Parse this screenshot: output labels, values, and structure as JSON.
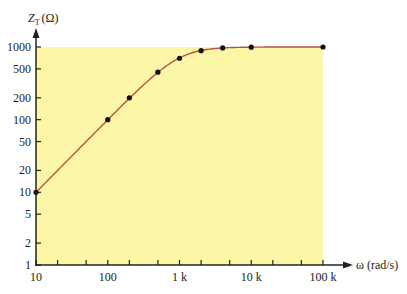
{
  "chart_data": {
    "type": "line",
    "title": "",
    "xlabel": "ω (rad/s)",
    "ylabel_main": "Z",
    "ylabel_sub": "T",
    "ylabel_unit": "(Ω)",
    "xscale": "log",
    "yscale": "log",
    "xlim": [
      10,
      100000
    ],
    "ylim": [
      1,
      1000
    ],
    "x_ticks": [
      10,
      100,
      1000,
      10000,
      100000
    ],
    "x_tick_labels": [
      "10",
      "100",
      "1 k",
      "10 k",
      "100 k"
    ],
    "x_minor_ticks": [
      20,
      50,
      200,
      500,
      2000,
      5000,
      20000,
      50000
    ],
    "y_ticks": [
      1,
      2,
      5,
      10,
      20,
      50,
      100,
      200,
      500,
      1000
    ],
    "y_tick_labels": [
      "1",
      "2",
      "5",
      "10",
      "20",
      "50",
      "100",
      "200",
      "500",
      "1000"
    ],
    "grid": false,
    "legend": null,
    "shaded_region": {
      "x": [
        10,
        100000
      ],
      "y": [
        1,
        1000
      ],
      "color": "#fbf7a6"
    },
    "series": [
      {
        "name": "Z_T",
        "color": "#b5524a",
        "x": [
          10,
          100,
          200,
          500,
          1000,
          2000,
          4000,
          10000,
          100000
        ],
        "y": [
          10,
          100,
          200,
          450,
          700,
          890,
          970,
          995,
          1000
        ],
        "markers": true
      }
    ]
  },
  "colors": {
    "background": "#ffffff",
    "shade": "#fbf7a6",
    "curve": "#b5524a",
    "axis": "#222222",
    "marker": "#111111"
  }
}
